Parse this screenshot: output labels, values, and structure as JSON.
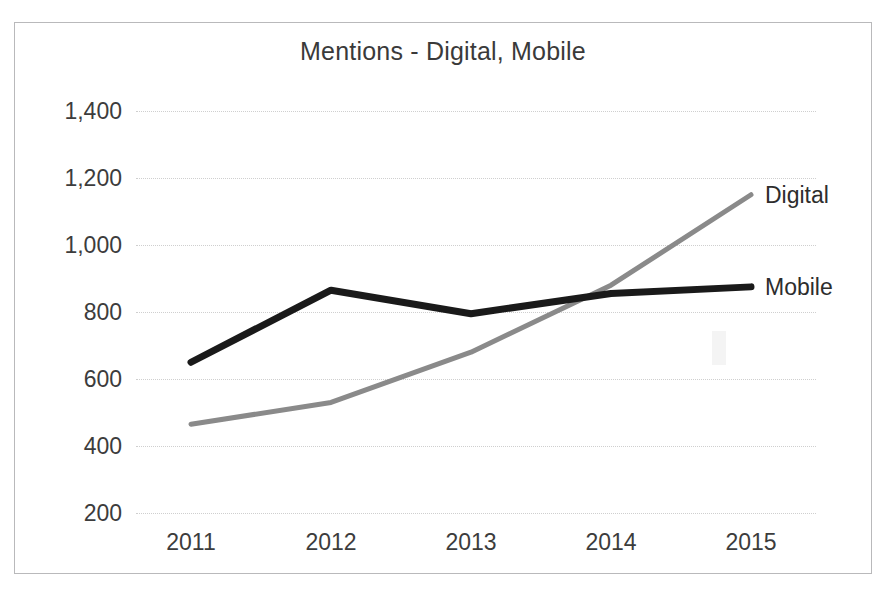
{
  "chart_data": {
    "type": "line",
    "title": "Mentions - Digital, Mobile",
    "xlabel": "",
    "ylabel": "",
    "categories": [
      "2011",
      "2012",
      "2013",
      "2014",
      "2015"
    ],
    "x": [
      2011,
      2012,
      2013,
      2014,
      2015
    ],
    "ylim": [
      200,
      1400
    ],
    "yticks": [
      "200",
      "400",
      "600",
      "800",
      "1,000",
      "1,200",
      "1,400"
    ],
    "ytick_values": [
      200,
      400,
      600,
      800,
      1000,
      1200,
      1400
    ],
    "grid": true,
    "legend_position": "right-inline-labels",
    "series": [
      {
        "name": "Digital",
        "color": "#8a8a8a",
        "width": 5,
        "values": [
          465,
          530,
          680,
          880,
          1150
        ],
        "label": "Digital"
      },
      {
        "name": "Mobile",
        "color": "#1a1a1a",
        "width": 7,
        "values": [
          650,
          865,
          795,
          855,
          875
        ],
        "label": "Mobile"
      }
    ]
  },
  "frame": {
    "border_color": "#b9b9bb",
    "background": "#ffffff"
  }
}
